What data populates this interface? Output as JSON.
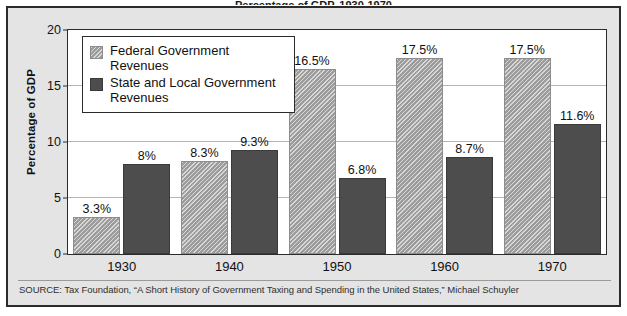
{
  "figure": {
    "title_fragment": "Percentage of GDP, 1930-1970",
    "source": "SOURCE: Tax Foundation, “A Short History of Government Taxing and Spending in the United States,” Michael Schuyler"
  },
  "legend": {
    "position": "inside-top-left",
    "entries": [
      {
        "label": "Federal Government Revenues",
        "swatch": "light-gray-hatched",
        "color": "#a9a9a9"
      },
      {
        "label": "State and Local Government Revenues",
        "swatch": "dark-gray-solid",
        "color": "#4d4d4d"
      }
    ]
  },
  "chart_data": {
    "type": "bar",
    "title": "Percentage of GDP, 1930-1970",
    "xlabel": "",
    "ylabel": "Percentage of GDP",
    "ylim": [
      0,
      20
    ],
    "yticks": [
      0,
      5,
      10,
      15,
      20
    ],
    "ytick_labels": [
      "0",
      "5",
      "10",
      "15",
      "20"
    ],
    "grid": true,
    "legend_position": "upper left (inside plot)",
    "categories": [
      "1930",
      "1940",
      "1950",
      "1960",
      "1970"
    ],
    "series": [
      {
        "name": "Federal Government Revenues",
        "color": "#a9a9a9",
        "pattern": "diagonal-hatch",
        "values": [
          3.3,
          8.3,
          16.5,
          17.5,
          17.5
        ],
        "labels": [
          "3.3%",
          "8.3%",
          "16.5%",
          "17.5%",
          "17.5%"
        ]
      },
      {
        "name": "State and Local Government Revenues",
        "color": "#4d4d4d",
        "pattern": "solid",
        "values": [
          8.0,
          9.3,
          6.8,
          8.7,
          11.6
        ],
        "labels": [
          "8%",
          "9.3%",
          "6.8%",
          "8.7%",
          "11.6%"
        ]
      }
    ]
  },
  "colors": {
    "panel_background": "#e4e4e4",
    "plot_background": "#ffffff",
    "frame": "#2b2b2b",
    "gridline": "#b4b4b4",
    "text": "#111111"
  }
}
